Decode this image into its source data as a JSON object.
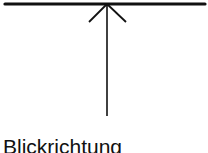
{
  "diagram": {
    "label": "Blickrichtung",
    "colors": {
      "stroke": "#111111",
      "background": "#ffffff"
    },
    "elements": [
      {
        "type": "line",
        "name": "horizontal-bar"
      },
      {
        "type": "arrow",
        "name": "viewing-direction-arrow",
        "direction": "up"
      }
    ]
  }
}
